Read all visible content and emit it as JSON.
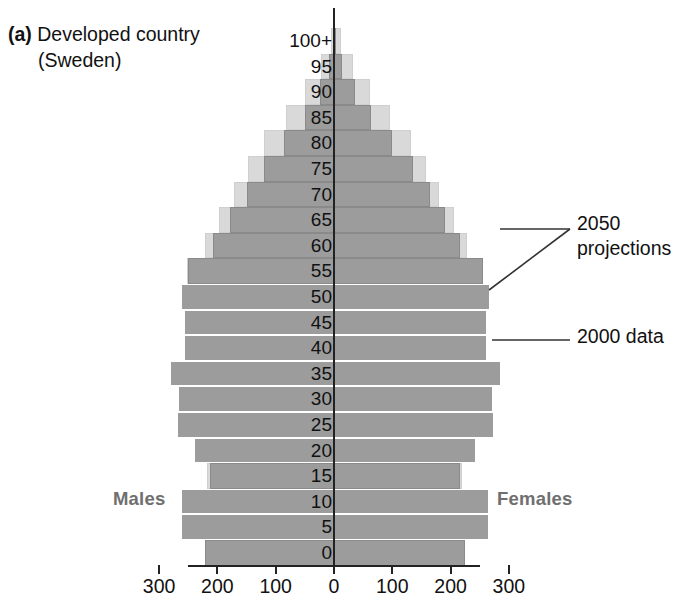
{
  "caption": {
    "label": "(a)",
    "line1": "Developed country",
    "line2": "(Sweden)"
  },
  "axis": {
    "y_title": "",
    "age_labels": [
      "100+",
      "95",
      "90",
      "85",
      "80",
      "75",
      "70",
      "65",
      "60",
      "55",
      "50",
      "45",
      "40",
      "35",
      "30",
      "25",
      "20",
      "15",
      "10",
      "5",
      "0"
    ],
    "x_tick_labels": [
      "300",
      "200",
      "100",
      "0",
      "100",
      "200",
      "300"
    ]
  },
  "sides": {
    "left": "Males",
    "right": "Females"
  },
  "annotations": {
    "projections_line1": "2050",
    "projections_line2": "projections",
    "data": "2000 data"
  },
  "colors": {
    "projection_fill": "#d9d9d9",
    "data_fill": "#9c9c9c",
    "axis": "#222222",
    "side_label": "#6f6f6f",
    "text": "#111111"
  },
  "chart_data": {
    "type": "bar",
    "subtype": "population-pyramid",
    "title": "(a) Developed country (Sweden)",
    "xlabel": "",
    "ylabel": "Age",
    "xlim": [
      -300,
      300
    ],
    "xunit": "thousands",
    "x_ticks": [
      -300,
      -200,
      -100,
      0,
      100,
      200,
      300
    ],
    "x_tick_labels": [
      "300",
      "200",
      "100",
      "0",
      "100",
      "200",
      "300"
    ],
    "grid": false,
    "legend": [
      "2050 projections",
      "2000 data"
    ],
    "legend_position": "right-annotations",
    "categories": [
      "100+",
      "95",
      "90",
      "85",
      "80",
      "75",
      "70",
      "65",
      "60",
      "55",
      "50",
      "45",
      "40",
      "35",
      "30",
      "25",
      "20",
      "15",
      "10",
      "5",
      "0"
    ],
    "series": [
      {
        "name": "2050 projections",
        "side": "males",
        "values": [
          6,
          22,
          50,
          82,
          120,
          148,
          172,
          198,
          222,
          252,
          232,
          240,
          240,
          252,
          248,
          244,
          230,
          218,
          228,
          228,
          222
        ]
      },
      {
        "name": "2050 projections",
        "side": "females",
        "values": [
          12,
          32,
          62,
          96,
          132,
          158,
          180,
          205,
          228,
          256,
          236,
          242,
          242,
          255,
          250,
          246,
          232,
          220,
          230,
          230,
          224
        ]
      },
      {
        "name": "2000 data",
        "side": "males",
        "values": [
          2,
          8,
          24,
          50,
          86,
          120,
          150,
          178,
          208,
          250,
          262,
          258,
          258,
          282,
          268,
          270,
          240,
          212,
          262,
          262,
          222
        ]
      },
      {
        "name": "2000 data",
        "side": "females",
        "values": [
          4,
          14,
          36,
          64,
          100,
          136,
          164,
          190,
          216,
          256,
          268,
          262,
          262,
          286,
          272,
          274,
          244,
          216,
          266,
          266,
          224
        ]
      }
    ]
  }
}
